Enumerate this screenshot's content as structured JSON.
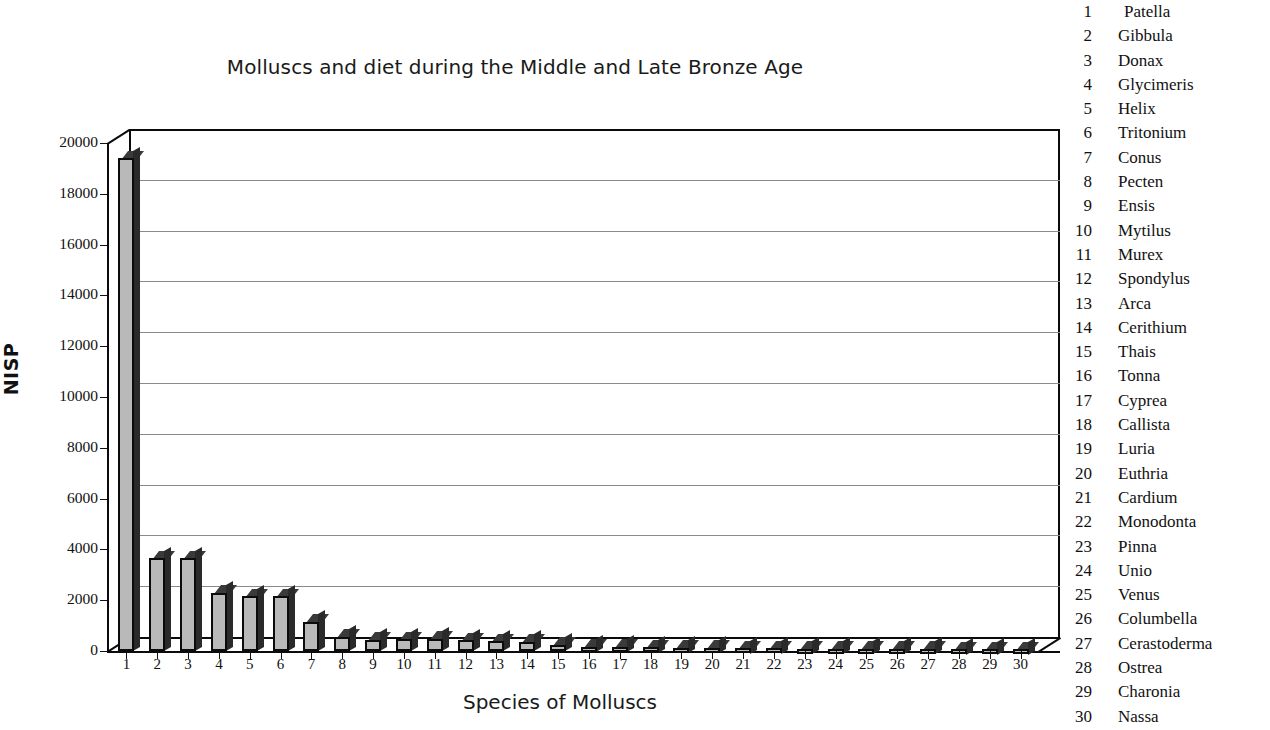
{
  "chart_data": {
    "type": "bar",
    "title": "Molluscs and diet during the Middle and Late Bronze Age",
    "xlabel": "Species of Molluscs",
    "ylabel": "NISP",
    "ylim": [
      0,
      20000
    ],
    "ytick_labels": [
      "20000",
      "18000",
      "16000",
      "14000",
      "12000",
      "10000",
      "8000",
      "6000",
      "4000",
      "2000",
      "0"
    ],
    "ytick_values": [
      20000,
      18000,
      16000,
      14000,
      12000,
      10000,
      8000,
      6000,
      4000,
      2000,
      0
    ],
    "grid": true,
    "legend_position": "right",
    "style": "3d-column",
    "categories": [
      "1",
      "2",
      "3",
      "4",
      "5",
      "6",
      "7",
      "8",
      "9",
      "10",
      "11",
      "12",
      "13",
      "14",
      "15",
      "16",
      "17",
      "18",
      "19",
      "20",
      "21",
      "22",
      "23",
      "24",
      "25",
      "26",
      "27",
      "28",
      "29",
      "30"
    ],
    "values": [
      19400,
      3650,
      3650,
      2300,
      2150,
      2150,
      1150,
      560,
      440,
      460,
      470,
      420,
      380,
      350,
      250,
      160,
      150,
      140,
      130,
      120,
      110,
      100,
      95,
      90,
      85,
      80,
      75,
      70,
      65,
      60
    ],
    "series": [
      {
        "name": "NISP",
        "values": [
          19400,
          3650,
          3650,
          2300,
          2150,
          2150,
          1150,
          560,
          440,
          460,
          470,
          420,
          380,
          350,
          250,
          160,
          150,
          140,
          130,
          120,
          110,
          100,
          95,
          90,
          85,
          80,
          75,
          70,
          65,
          60
        ]
      }
    ],
    "bar_color": "#b9b9b9",
    "bar_edge_color": "#0b0b0b"
  },
  "legend": {
    "items": [
      {
        "num": "1",
        "name": "Patella"
      },
      {
        "num": "2",
        "name": "Gibbula"
      },
      {
        "num": "3",
        "name": "Donax"
      },
      {
        "num": "4",
        "name": "Glycimeris"
      },
      {
        "num": "5",
        "name": "Helix"
      },
      {
        "num": "6",
        "name": "Tritonium"
      },
      {
        "num": "7",
        "name": "Conus"
      },
      {
        "num": "8",
        "name": "Pecten"
      },
      {
        "num": "9",
        "name": "Ensis"
      },
      {
        "num": "10",
        "name": "Mytilus"
      },
      {
        "num": "11",
        "name": "Murex"
      },
      {
        "num": "12",
        "name": "Spondylus"
      },
      {
        "num": "13",
        "name": "Arca"
      },
      {
        "num": "14",
        "name": "Cerithium"
      },
      {
        "num": "15",
        "name": "Thais"
      },
      {
        "num": "16",
        "name": "Tonna"
      },
      {
        "num": "17",
        "name": "Cyprea"
      },
      {
        "num": "18",
        "name": "Callista"
      },
      {
        "num": "19",
        "name": "Luria"
      },
      {
        "num": "20",
        "name": "Euthria"
      },
      {
        "num": "21",
        "name": "Cardium"
      },
      {
        "num": "22",
        "name": "Monodonta"
      },
      {
        "num": "23",
        "name": "Pinna"
      },
      {
        "num": "24",
        "name": "Unio"
      },
      {
        "num": "25",
        "name": "Venus"
      },
      {
        "num": "26",
        "name": "Columbella"
      },
      {
        "num": "27",
        "name": "Cerastoderma"
      },
      {
        "num": "28",
        "name": "Ostrea"
      },
      {
        "num": "29",
        "name": "Charonia"
      },
      {
        "num": "30",
        "name": "Nassa"
      }
    ]
  }
}
